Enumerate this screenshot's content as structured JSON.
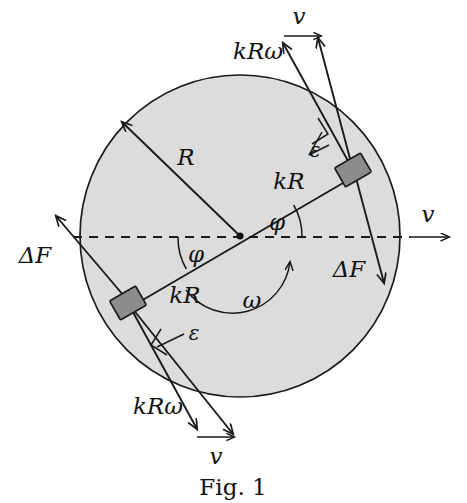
{
  "figure": {
    "caption": "Fig. 1",
    "kind": "physics-free-body-diagram"
  },
  "colors": {
    "disk_fill": "#dcdcdc",
    "outline": "#1a1a1a",
    "block_fill": "#8c8c8c",
    "background": "#ffffff"
  },
  "geometry": {
    "center": {
      "x": 240,
      "y": 236
    },
    "disk_radius": 160,
    "phi_degrees": 30,
    "kR_fraction": 0.82,
    "block_upper_right": {
      "x": 353,
      "y": 170
    },
    "block_lower_left": {
      "x": 128,
      "y": 303
    }
  },
  "labels": {
    "radius": "R",
    "kR_upper": "kR",
    "kR_lower": "kR",
    "phi_right": "φ",
    "phi_left": "φ",
    "omega": "ω",
    "epsilon_upper": "ε",
    "epsilon_lower": "ε",
    "kRomega_upper": "kRω",
    "kRomega_lower": "kRω",
    "v_top": "v",
    "v_bottom": "v",
    "v_right": "v",
    "deltaF_left": "ΔF",
    "deltaF_right": "ΔF"
  }
}
